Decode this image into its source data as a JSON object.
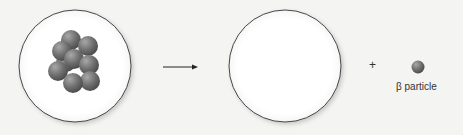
{
  "diagram": {
    "reactant": {
      "name": "nucleus",
      "particle_count": 9,
      "particle_color": "#707070"
    },
    "product": {
      "name": "nucleus",
      "particle_count": 0
    },
    "arrow": "→",
    "plus": "+",
    "emitted": {
      "label": "β particle",
      "color": "#7a7a7a"
    }
  }
}
